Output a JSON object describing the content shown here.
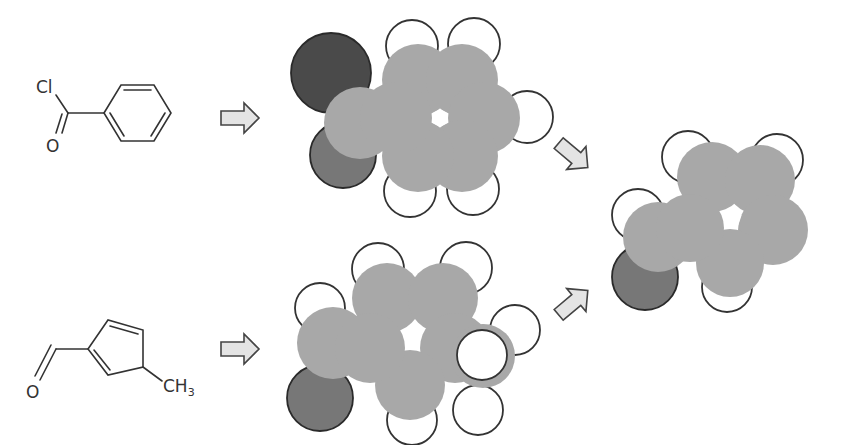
{
  "diagram": {
    "title": "",
    "reactants": [
      {
        "name": "benzoyl chloride",
        "labels": {
          "cl": "Cl",
          "o": "O"
        }
      },
      {
        "name": "methylcyclopentadiene carbaldehyde",
        "labels": {
          "o": "O",
          "ch3_main": "CH",
          "ch3_sub": "3"
        }
      }
    ],
    "arrows": [
      {
        "name": "arrow-top-right",
        "direction": "right"
      },
      {
        "name": "arrow-bottom-right",
        "direction": "right"
      },
      {
        "name": "arrow-down-right",
        "direction": "down-right"
      },
      {
        "name": "arrow-up-right",
        "direction": "up-right"
      }
    ],
    "colors": {
      "carbon": "#a8a8a8",
      "hydrogen": "#ffffff",
      "chlorine": "#4a4a4a",
      "oxygen": "#777777",
      "outline": "#333333",
      "arrow_fill": "#e4e4e4"
    },
    "space_filling_models": [
      {
        "name": "acylium-benzene-model",
        "atoms": [
          {
            "el": "H",
            "x": 412,
            "y": 46,
            "r": 26
          },
          {
            "el": "H",
            "x": 474,
            "y": 44,
            "r": 26
          },
          {
            "el": "H",
            "x": 527,
            "y": 117,
            "r": 26
          },
          {
            "el": "H",
            "x": 473,
            "y": 189,
            "r": 26
          },
          {
            "el": "H",
            "x": 410,
            "y": 191,
            "r": 26
          },
          {
            "el": "Cl",
            "x": 331,
            "y": 73,
            "r": 40
          },
          {
            "el": "O",
            "x": 343,
            "y": 155,
            "r": 33
          },
          {
            "el": "C",
            "x": 360,
            "y": 123,
            "r": 36
          },
          {
            "el": "C",
            "x": 418,
            "y": 80,
            "r": 36
          },
          {
            "el": "C",
            "x": 462,
            "y": 80,
            "r": 36
          },
          {
            "el": "C",
            "x": 484,
            "y": 118,
            "r": 36
          },
          {
            "el": "C",
            "x": 462,
            "y": 156,
            "r": 36
          },
          {
            "el": "C",
            "x": 418,
            "y": 156,
            "r": 36
          },
          {
            "el": "C",
            "x": 396,
            "y": 118,
            "r": 36
          }
        ],
        "hole": {
          "shape": "hexagon",
          "x": 440,
          "y": 118,
          "r": 9
        }
      },
      {
        "name": "cyclopentadiene-aldehyde-model",
        "atoms": [
          {
            "el": "H",
            "x": 320,
            "y": 308,
            "r": 25
          },
          {
            "el": "H",
            "x": 378,
            "y": 269,
            "r": 26
          },
          {
            "el": "H",
            "x": 466,
            "y": 268,
            "r": 26
          },
          {
            "el": "H",
            "x": 515,
            "y": 330,
            "r": 25
          },
          {
            "el": "H",
            "x": 478,
            "y": 410,
            "r": 25
          },
          {
            "el": "H",
            "x": 412,
            "y": 420,
            "r": 25
          },
          {
            "el": "O",
            "x": 320,
            "y": 398,
            "r": 33
          },
          {
            "el": "C",
            "x": 333,
            "y": 343,
            "r": 36
          },
          {
            "el": "C",
            "x": 387,
            "y": 298,
            "r": 35
          },
          {
            "el": "C",
            "x": 443,
            "y": 298,
            "r": 35
          },
          {
            "el": "C",
            "x": 455,
            "y": 348,
            "r": 35
          },
          {
            "el": "C",
            "x": 410,
            "y": 385,
            "r": 35
          },
          {
            "el": "C",
            "x": 370,
            "y": 348,
            "r": 35
          },
          {
            "el": "C",
            "x": 483,
            "y": 356,
            "r": 32
          },
          {
            "el": "H",
            "x": 482,
            "y": 355,
            "r": 25
          }
        ],
        "hole": {
          "shape": "pentagon",
          "x": 413,
          "y": 337,
          "r": 9
        }
      },
      {
        "name": "product-model",
        "atoms": [
          {
            "el": "H",
            "x": 638,
            "y": 215,
            "r": 26
          },
          {
            "el": "H",
            "x": 688,
            "y": 157,
            "r": 26
          },
          {
            "el": "H",
            "x": 777,
            "y": 160,
            "r": 26
          },
          {
            "el": "H",
            "x": 727,
            "y": 287,
            "r": 25
          },
          {
            "el": "O",
            "x": 645,
            "y": 277,
            "r": 33
          },
          {
            "el": "C",
            "x": 658,
            "y": 237,
            "r": 35
          },
          {
            "el": "C",
            "x": 712,
            "y": 177,
            "r": 35
          },
          {
            "el": "C",
            "x": 760,
            "y": 180,
            "r": 35
          },
          {
            "el": "C",
            "x": 773,
            "y": 230,
            "r": 35
          },
          {
            "el": "C",
            "x": 730,
            "y": 263,
            "r": 34
          },
          {
            "el": "C",
            "x": 690,
            "y": 228,
            "r": 34
          }
        ],
        "hole": {
          "shape": "pentagon",
          "x": 733,
          "y": 218,
          "r": 9
        }
      }
    ]
  }
}
